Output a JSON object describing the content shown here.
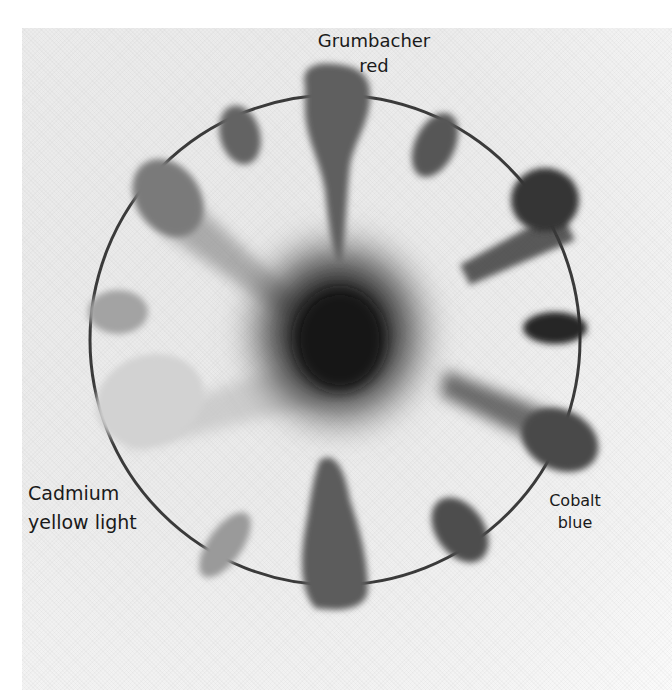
{
  "image": {
    "description": "Hand-painted color wheel on textured canvas paper, grayscale reproduction, with twelve paint swatches around a drawn circle blending toward a dark center",
    "background_color": "#ececec",
    "circle_stroke_color": "#3a3a3a"
  },
  "labels": {
    "top": {
      "line1": "Grumbacher",
      "line2": "red"
    },
    "left": {
      "line1": "Cadmium",
      "line2": "yellow light"
    },
    "right": {
      "line1": "Cobalt",
      "line2": "blue"
    }
  },
  "swatches": [
    {
      "position": "top",
      "shade": "#5f5f5f"
    },
    {
      "position": "top-right-1",
      "shade": "#575757"
    },
    {
      "position": "top-right-2",
      "shade": "#353535"
    },
    {
      "position": "right",
      "shade": "#262626"
    },
    {
      "position": "bottom-right-1",
      "shade": "#4a4a4a"
    },
    {
      "position": "bottom-right-2",
      "shade": "#4e4e4e"
    },
    {
      "position": "bottom",
      "shade": "#5c5c5c"
    },
    {
      "position": "bottom-left",
      "shade": "#9a9a9a"
    },
    {
      "position": "left-lower",
      "shade": "#d2d2d2"
    },
    {
      "position": "left",
      "shade": "#a3a3a3"
    },
    {
      "position": "top-left-1",
      "shade": "#7a7a7a"
    },
    {
      "position": "top-left-2",
      "shade": "#636363"
    },
    {
      "position": "center",
      "shade": "#141414"
    }
  ]
}
